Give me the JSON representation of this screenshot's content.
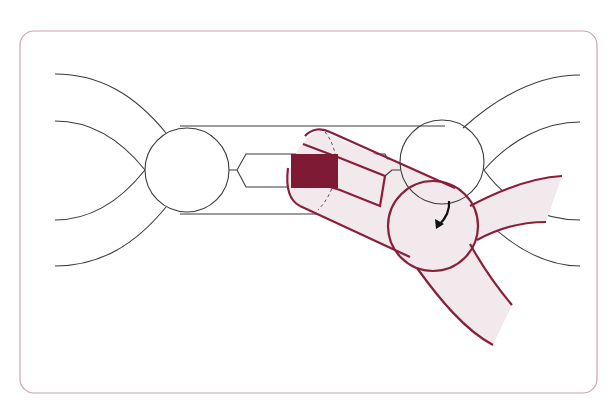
{
  "diagram": {
    "title": "",
    "colors": {
      "frame_stroke": "#c9a6b0",
      "line": "#3a3a3a",
      "accent": "#8a1f3a",
      "accent_fill": "#f1e9ec",
      "block": "#7e1a33",
      "arrow": "#111111"
    },
    "elements": {
      "left_node": {
        "cx": 187,
        "cy": 170,
        "r": 42
      },
      "right_node": {
        "cx": 442,
        "cy": 162,
        "r": 42
      },
      "highlight_node": {
        "cx": 433,
        "cy": 226,
        "r": 45
      },
      "block": {
        "x": 291,
        "y": 154,
        "w": 47,
        "h": 34
      },
      "rotation_arrow": "curved-arrow-clockwise"
    }
  }
}
